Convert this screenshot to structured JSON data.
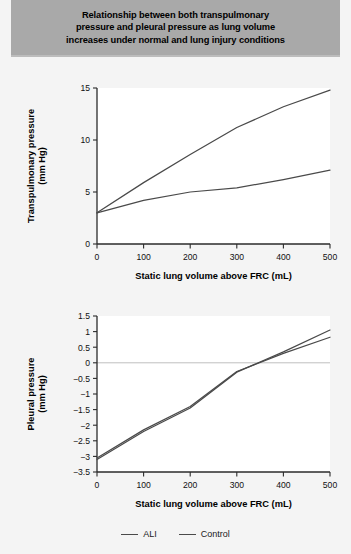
{
  "figure": {
    "title_lines": [
      "Relationship between both transpulmonary",
      "pressure and pleural pressure as lung volume",
      "increases under normal and lung injury conditions"
    ],
    "title_band_color": "#a9a9a9",
    "background_color": "#f4f4f4",
    "line_color": "#4a4a4a"
  },
  "legend": {
    "position": "bottom-center",
    "items": [
      {
        "label": "ALI",
        "color": "#4a4a4a"
      },
      {
        "label": "Control",
        "color": "#4a4a4a"
      }
    ]
  },
  "chart_data": [
    {
      "id": "transpulmonary",
      "type": "line",
      "title": "",
      "xlabel": "Static lung volume above FRC (mL)",
      "ylabel": "Transpulmonary pressure\n(mm Hg)",
      "ylabel_line1": "Transpulmonary pressure",
      "ylabel_line2": "(mm Hg)",
      "xlim": [
        0,
        500
      ],
      "ylim": [
        0,
        15
      ],
      "xticks": [
        0,
        100,
        200,
        300,
        400,
        500
      ],
      "yticks": [
        0,
        5,
        10,
        15
      ],
      "xticklabels": [
        "0",
        "100",
        "200",
        "300",
        "400",
        "500"
      ],
      "yticklabels": [
        "0",
        "5",
        "10",
        "15"
      ],
      "grid": false,
      "zero_line": false,
      "x": [
        0,
        100,
        200,
        300,
        400,
        500
      ],
      "series": [
        {
          "name": "ALI",
          "values": [
            3.0,
            5.9,
            8.6,
            11.2,
            13.2,
            14.8
          ]
        },
        {
          "name": "Control",
          "values": [
            3.0,
            4.2,
            5.0,
            5.4,
            6.2,
            7.1
          ]
        }
      ]
    },
    {
      "id": "pleural",
      "type": "line",
      "title": "",
      "xlabel": "Static lung volume above FRC (mL)",
      "ylabel": "Pleural pressure\n(mm Hg)",
      "ylabel_line1": "Pleural pressure",
      "ylabel_line2": "(mm Hg)",
      "xlim": [
        0,
        500
      ],
      "ylim": [
        -3.5,
        1.5
      ],
      "xticks": [
        0,
        100,
        200,
        300,
        400,
        500
      ],
      "yticks": [
        -3.5,
        -3,
        -2.5,
        -2,
        -1.5,
        -1,
        -0.5,
        0,
        0.5,
        1,
        1.5
      ],
      "xticklabels": [
        "0",
        "100",
        "200",
        "300",
        "400",
        "500"
      ],
      "yticklabels": [
        "−3.5",
        "−3",
        "−2.5",
        "−2",
        "−1.5",
        "−1",
        "−0.5",
        "0",
        "0.5",
        "1",
        "1.5"
      ],
      "grid": false,
      "zero_line": true,
      "x": [
        0,
        100,
        200,
        300,
        400,
        500
      ],
      "series": [
        {
          "name": "ALI",
          "values": [
            -3.1,
            -2.2,
            -1.45,
            -0.3,
            0.35,
            1.05
          ]
        },
        {
          "name": "Control",
          "values": [
            -3.05,
            -2.15,
            -1.4,
            -0.28,
            0.3,
            0.82
          ]
        }
      ]
    }
  ]
}
